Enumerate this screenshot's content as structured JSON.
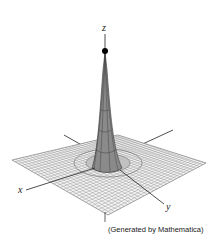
{
  "figure": {
    "axes": {
      "x_label": "x",
      "y_label": "y",
      "z_label": "z"
    },
    "caption": "(Generated by Mathematica)",
    "colors": {
      "surface": "#8a8a8a",
      "mesh": "#555555",
      "plane_fill": "#f2f2f2",
      "axis": "#222222",
      "peak_dot": "#000000"
    }
  }
}
